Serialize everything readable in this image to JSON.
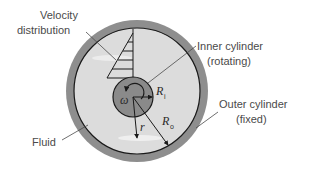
{
  "diagram": {
    "colors": {
      "outer_wall": "#8e8e8e",
      "fluid": "#dcdcdc",
      "inner_cylinder": "#8a8a8a",
      "line": "#1a1a1a",
      "label_text": "#4a4a4a"
    },
    "labels": {
      "velocity_line1": "Velocity",
      "velocity_line2": "distribution",
      "inner_line1": "Inner cylinder",
      "inner_line2": "(rotating)",
      "outer_line1": "Outer cylinder",
      "outer_line2": "(fixed)",
      "fluid": "Fluid"
    },
    "symbols": {
      "omega": "ω",
      "r": "r",
      "R": "R",
      "ri_sub": "i",
      "ro_sub": "o"
    }
  }
}
